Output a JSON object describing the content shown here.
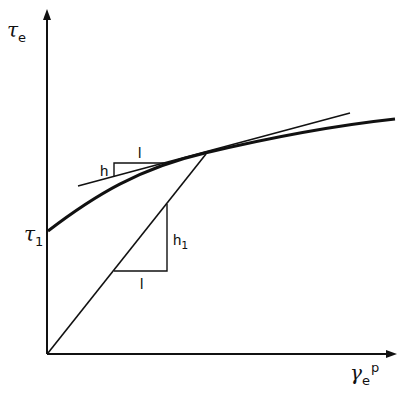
{
  "diagram": {
    "title": "",
    "y_axis": {
      "symbol": "τ",
      "subscript": "e"
    },
    "x_axis": {
      "symbol": "γ",
      "subscript": "e",
      "superscript": "p"
    },
    "y_intercept_label": {
      "symbol": "τ",
      "subscript": "1"
    },
    "tangent_slope": {
      "rise_label": "h",
      "run_label": "l"
    },
    "secant_slope": {
      "rise_label": "h",
      "rise_subscript": "1",
      "run_label": "l"
    },
    "colors": {
      "ink": "#111111",
      "background": "#ffffff"
    }
  }
}
